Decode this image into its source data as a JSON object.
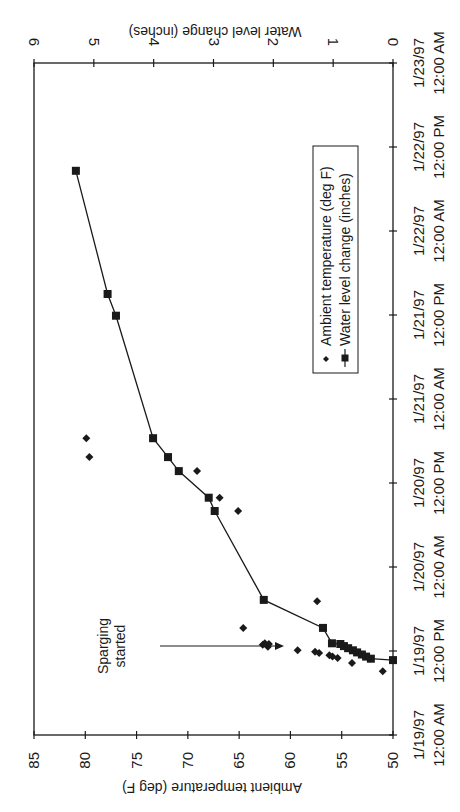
{
  "chart_data": {
    "type": "scatter",
    "orientation": "rotated-90-cw",
    "title": "",
    "xlabel": "",
    "x_ticks": [
      "1/19/97 12:00 AM",
      "1/19/97 12:00 PM",
      "1/20/97 12:00 AM",
      "1/20/97 12:00 PM",
      "1/21/97 12:00 AM",
      "1/21/97 12:00 PM",
      "1/22/97 12:00 AM",
      "1/22/97 12:00 PM",
      "1/23/97 12:00 AM"
    ],
    "x_tick_lines": [
      [
        "1/19/97",
        "12:00 AM"
      ],
      [
        "1/19/97",
        "12:00 PM"
      ],
      [
        "1/20/97",
        "12:00 AM"
      ],
      [
        "1/20/97",
        "12:00 PM"
      ],
      [
        "1/21/97",
        "12:00 AM"
      ],
      [
        "1/21/97",
        "12:00 PM"
      ],
      [
        "1/22/97",
        "12:00 AM"
      ],
      [
        "1/22/97",
        "12:00 PM"
      ],
      [
        "1/23/97",
        "12:00 AM"
      ]
    ],
    "x_unit": "hours since 1/19/97 12:00 AM",
    "xlim": [
      0,
      96
    ],
    "y_left": {
      "label": "Ambient temperature (deg F)",
      "ylim": [
        50,
        85
      ],
      "ticks": [
        "50",
        "55",
        "60",
        "65",
        "70",
        "75",
        "80",
        "85"
      ]
    },
    "y_right": {
      "label": "Water level change (inches)",
      "ylim": [
        0,
        6
      ],
      "ticks": [
        "0",
        "1",
        "2",
        "3",
        "4",
        "5",
        "6"
      ]
    },
    "grid": false,
    "legend_position": "inside, upper-middle",
    "series": [
      {
        "name": "Ambient temperature (deg F)",
        "axis": "left",
        "marker": "diamond",
        "line": false,
        "points": [
          {
            "x": 9.1,
            "y": 51.0
          },
          {
            "x": 10.3,
            "y": 54.0
          },
          {
            "x": 11.0,
            "y": 55.4
          },
          {
            "x": 11.2,
            "y": 55.9
          },
          {
            "x": 11.4,
            "y": 56.2
          },
          {
            "x": 11.7,
            "y": 57.2
          },
          {
            "x": 11.9,
            "y": 57.6
          },
          {
            "x": 12.1,
            "y": 59.3
          },
          {
            "x": 12.6,
            "y": 62.2
          },
          {
            "x": 12.9,
            "y": 62.7
          },
          {
            "x": 13.0,
            "y": 62.1
          },
          {
            "x": 13.1,
            "y": 62.5
          },
          {
            "x": 15.3,
            "y": 64.6
          },
          {
            "x": 19.1,
            "y": 57.4
          },
          {
            "x": 32.0,
            "y": 65.1
          },
          {
            "x": 33.9,
            "y": 66.9
          },
          {
            "x": 37.7,
            "y": 69.1
          },
          {
            "x": 39.7,
            "y": 79.6
          },
          {
            "x": 42.4,
            "y": 79.9
          }
        ]
      },
      {
        "name": "Water level change (inches)",
        "axis": "right",
        "marker": "square",
        "line": true,
        "points": [
          {
            "x": 10.7,
            "y": 0.0
          },
          {
            "x": 10.9,
            "y": 0.37
          },
          {
            "x": 11.2,
            "y": 0.45
          },
          {
            "x": 11.5,
            "y": 0.52
          },
          {
            "x": 11.8,
            "y": 0.6
          },
          {
            "x": 12.1,
            "y": 0.67
          },
          {
            "x": 12.4,
            "y": 0.75
          },
          {
            "x": 12.7,
            "y": 0.82
          },
          {
            "x": 13.0,
            "y": 0.88
          },
          {
            "x": 13.1,
            "y": 1.02
          },
          {
            "x": 15.3,
            "y": 1.17
          },
          {
            "x": 19.3,
            "y": 2.16
          },
          {
            "x": 32.0,
            "y": 2.98
          },
          {
            "x": 33.9,
            "y": 3.08
          },
          {
            "x": 37.7,
            "y": 3.58
          },
          {
            "x": 39.7,
            "y": 3.76
          },
          {
            "x": 42.4,
            "y": 4.01
          },
          {
            "x": 59.9,
            "y": 4.63
          },
          {
            "x": 63.0,
            "y": 4.77
          },
          {
            "x": 80.6,
            "y": 5.3
          }
        ]
      }
    ],
    "annotations": [
      {
        "text_lines": [
          "Sparging",
          "started"
        ],
        "arrow_at_x": 13.0
      }
    ]
  },
  "legend": {
    "items": [
      "Ambient temperature (deg F)",
      "Water level change (inches)"
    ]
  }
}
